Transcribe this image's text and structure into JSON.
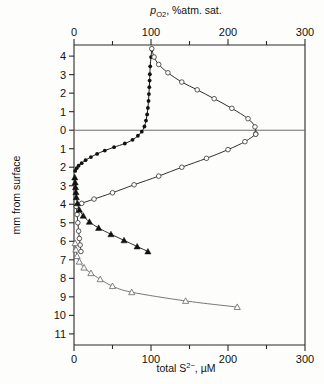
{
  "chart_data": {
    "type": "scatter",
    "title": "",
    "top_axis": {
      "label_parts": {
        "italic": "p",
        "sub": "O2",
        "rest": ", %atm. sat."
      },
      "label": "pO2, %atm. sat.",
      "ticks": [
        0,
        50,
        100,
        150,
        200,
        250,
        300
      ],
      "tick_labels": [
        "0",
        "",
        "100",
        "",
        "200",
        "",
        "300"
      ],
      "range": [
        0,
        300
      ]
    },
    "bottom_axis": {
      "label_parts": {
        "pre": "total S",
        "sup": "2−",
        "rest": ", µM"
      },
      "label": "total S2-, µM",
      "ticks": [
        0,
        50,
        100,
        150,
        200,
        250,
        300
      ],
      "tick_labels": [
        "0",
        "",
        "100",
        "",
        "200",
        "",
        "300"
      ],
      "range": [
        0,
        300
      ]
    },
    "y_axis": {
      "label": "mm from surface",
      "ticks": [
        -4,
        -3,
        -2,
        -1,
        0,
        1,
        2,
        3,
        4,
        5,
        6,
        7,
        8,
        9,
        10,
        11
      ],
      "tick_labels": [
        "4",
        "3",
        "2",
        "1",
        "0",
        "1",
        "2",
        "3",
        "4",
        "5",
        "6",
        "7",
        "8",
        "9",
        "10",
        "11"
      ],
      "range": [
        -4.6,
        11.6
      ],
      "zero_line_at": 0
    },
    "grid": false,
    "legend": "none",
    "series": [
      {
        "name": "oxygen-filled-circles",
        "marker": "filled-circle",
        "axis": "top",
        "points": [
          [
            1.5,
            2.2
          ],
          [
            3.5,
            2.05
          ],
          [
            6.0,
            1.92
          ],
          [
            10.0,
            1.78
          ],
          [
            15.0,
            1.62
          ],
          [
            22.0,
            1.45
          ],
          [
            30.0,
            1.28
          ],
          [
            40.0,
            1.1
          ],
          [
            52.0,
            0.92
          ],
          [
            66.0,
            0.72
          ],
          [
            76.0,
            0.52
          ],
          [
            83.0,
            0.3
          ],
          [
            88.0,
            0.08
          ],
          [
            91.5,
            -0.2
          ],
          [
            93.5,
            -0.52
          ],
          [
            95.0,
            -0.85
          ],
          [
            96.0,
            -1.2
          ],
          [
            96.8,
            -1.58
          ],
          [
            97.3,
            -1.95
          ],
          [
            97.8,
            -2.32
          ],
          [
            98.2,
            -2.68
          ],
          [
            98.5,
            -3.02
          ],
          [
            99.0,
            -3.45
          ],
          [
            100.0,
            -3.95
          ],
          [
            101.0,
            -4.35
          ]
        ]
      },
      {
        "name": "sulfide-open-circles-upper",
        "marker": "open-circle",
        "axis": "bottom",
        "points": [
          [
            101.0,
            -4.4
          ],
          [
            104.0,
            -3.95
          ],
          [
            110.0,
            -3.55
          ],
          [
            122.0,
            -3.1
          ],
          [
            140.0,
            -2.6
          ],
          [
            160.0,
            -2.18
          ],
          [
            182.0,
            -1.7
          ],
          [
            205.0,
            -1.18
          ],
          [
            226.0,
            -0.62
          ],
          [
            235.0,
            -0.18
          ],
          [
            236.0,
            0.2
          ]
        ]
      },
      {
        "name": "sulfide-open-circles-lower",
        "marker": "open-circle",
        "axis": "bottom",
        "points": [
          [
            236.0,
            0.22
          ],
          [
            222.0,
            0.62
          ],
          [
            200.0,
            1.05
          ],
          [
            172.0,
            1.52
          ],
          [
            140.0,
            2.0
          ],
          [
            110.0,
            2.48
          ],
          [
            78.0,
            2.95
          ],
          [
            50.0,
            3.38
          ],
          [
            26.0,
            3.72
          ],
          [
            10.0,
            3.95
          ],
          [
            3.0,
            4.1
          ]
        ]
      },
      {
        "name": "sulfide-open-circles-descending",
        "marker": "open-circle",
        "axis": "bottom",
        "points": [
          [
            3.0,
            4.12
          ],
          [
            4.0,
            4.55
          ],
          [
            5.0,
            5.0
          ],
          [
            6.0,
            5.45
          ],
          [
            7.0,
            5.85
          ],
          [
            8.0,
            6.2
          ],
          [
            9.0,
            6.55
          ]
        ]
      },
      {
        "name": "filled-triangles",
        "marker": "filled-triangle",
        "axis": "bottom",
        "points": [
          [
            1.0,
            2.55
          ],
          [
            1.5,
            2.82
          ],
          [
            2.0,
            3.08
          ],
          [
            2.5,
            3.35
          ],
          [
            3.0,
            3.62
          ],
          [
            4.5,
            3.95
          ],
          [
            7.0,
            4.3
          ],
          [
            12.0,
            4.62
          ],
          [
            20.0,
            4.95
          ],
          [
            32.0,
            5.28
          ],
          [
            48.0,
            5.62
          ],
          [
            65.0,
            5.95
          ],
          [
            82.0,
            6.28
          ],
          [
            96.0,
            6.55
          ]
        ]
      },
      {
        "name": "open-triangles",
        "marker": "open-triangle",
        "axis": "bottom",
        "points": [
          [
            1.5,
            6.1
          ],
          [
            2.5,
            6.45
          ],
          [
            4.0,
            6.8
          ],
          [
            7.0,
            7.1
          ],
          [
            13.0,
            7.42
          ],
          [
            22.0,
            7.72
          ],
          [
            34.0,
            8.05
          ],
          [
            50.0,
            8.42
          ],
          [
            75.0,
            8.75
          ],
          [
            145.0,
            9.22
          ],
          [
            212.0,
            9.55
          ]
        ]
      }
    ]
  },
  "figure": {
    "background": "#fdfdfb",
    "ink": "#1a1a1a"
  }
}
